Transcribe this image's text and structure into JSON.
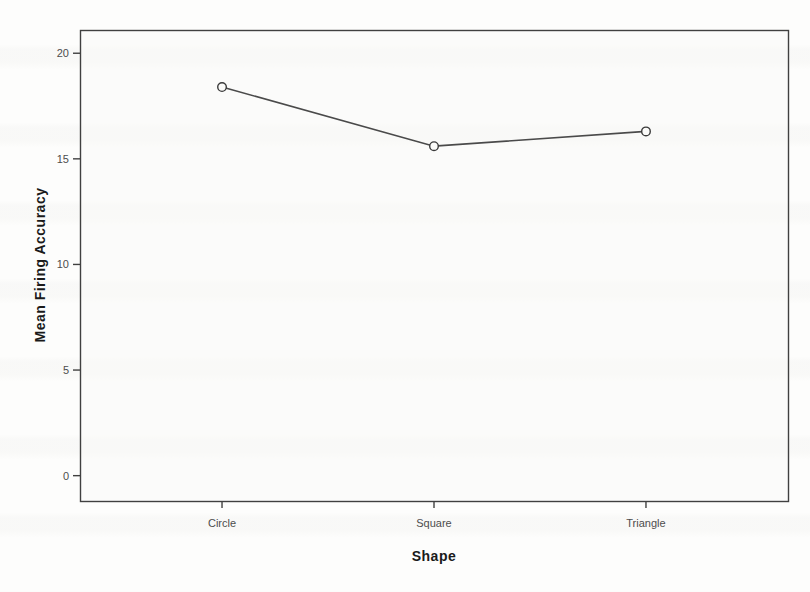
{
  "chart_data": {
    "type": "line",
    "title": "",
    "categories": [
      "Circle",
      "Square",
      "Triangle"
    ],
    "values": [
      18.4,
      15.6,
      16.3
    ],
    "series_name": "Mean Firing Accuracy",
    "xlabel": "Shape",
    "ylabel": "Mean Firing Accuracy",
    "yticks": [
      0,
      5,
      10,
      15,
      20
    ],
    "ylim": [
      -1.2,
      21.1
    ],
    "grid": false,
    "legend": "none",
    "marker": "open-circle",
    "colors": {
      "line": "#4a4a4a",
      "marker_stroke": "#3a3a3a",
      "marker_fill": "#fbfbf9",
      "frame": "#404040",
      "tick_label": "#4d4d4d",
      "axis_title": "#1a1a1a",
      "plot_bg": "#fafaf8",
      "page_bg": "#fdfdfc"
    }
  }
}
